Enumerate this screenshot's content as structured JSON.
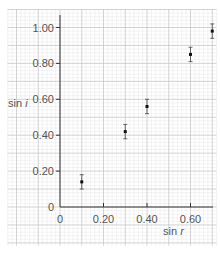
{
  "chart_data": {
    "type": "scatter",
    "title": "",
    "xlabel": "sin r",
    "ylabel": "sin i",
    "xlabel_parts": [
      "sin ",
      "r"
    ],
    "ylabel_parts": [
      "sin ",
      "i"
    ],
    "xlim": [
      0,
      0.8
    ],
    "ylim": [
      0,
      1.0
    ],
    "x_ticks": [
      0,
      0.2,
      0.4,
      0.6,
      0.8
    ],
    "x_tick_labels": [
      "0",
      "0.20",
      "0.40",
      "0.60",
      "0.80"
    ],
    "y_ticks": [
      0,
      0.2,
      0.4,
      0.6,
      0.8,
      1.0
    ],
    "y_tick_labels": [
      "0",
      "0.20",
      "0.40",
      "0.60",
      "0.80",
      "1.00"
    ],
    "grid": true,
    "grid_style": "graph paper (major 0.1, minor 0.02)",
    "legend": null,
    "series": [
      {
        "name": "measurements",
        "points": [
          {
            "x": 0.1,
            "y": 0.14,
            "y_err": 0.04
          },
          {
            "x": 0.3,
            "y": 0.42,
            "y_err": 0.04
          },
          {
            "x": 0.4,
            "y": 0.56,
            "y_err": 0.04
          },
          {
            "x": 0.6,
            "y": 0.85,
            "y_err": 0.04
          },
          {
            "x": 0.7,
            "y": 0.98,
            "y_err": 0.04
          }
        ]
      }
    ]
  },
  "colors": {
    "grid_major": "#c8c8c8",
    "grid_minor": "#e6e6e6",
    "axis": "#333333",
    "text": "#555555",
    "points": "#111111"
  }
}
